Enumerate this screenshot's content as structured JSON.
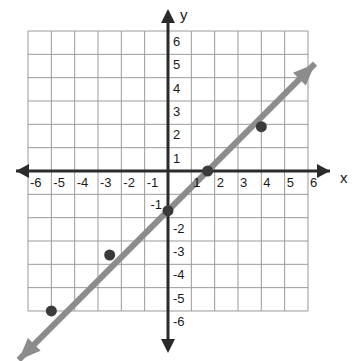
{
  "chart_data": {
    "type": "line",
    "title": "",
    "xlabel": "x",
    "ylabel": "y",
    "grid": true,
    "legend": "none",
    "xlim": [
      -6,
      6
    ],
    "ylim": [
      -6,
      6
    ],
    "x_ticks": [
      -6,
      -5,
      -4,
      -3,
      -2,
      -1,
      1,
      2,
      3,
      4,
      5,
      6
    ],
    "y_ticks": [
      6,
      5,
      4,
      3,
      2,
      1,
      -1,
      -2,
      -3,
      -4,
      -5,
      -6
    ],
    "x_tick_labels": [
      "-6",
      "-5",
      "-4",
      "-3",
      "-2",
      "-1",
      "1",
      "2",
      "3",
      "4",
      "5",
      "6"
    ],
    "y_tick_labels": [
      "6",
      "5",
      "4",
      "3",
      "2",
      "1",
      "-1",
      "-2",
      "-3",
      "-4",
      "-5",
      "-6"
    ],
    "series": [
      {
        "name": "line",
        "type": "line",
        "slope": 1,
        "intercept": -1.7,
        "color": "#8c8c8c",
        "arrow_start": true,
        "arrow_end": true,
        "x_start": -6.4,
        "x_end": 6.3
      },
      {
        "name": "plotted-points",
        "type": "scatter",
        "color": "#3a3a3a",
        "points": [
          {
            "x": -5.0,
            "y": -6.0
          },
          {
            "x": -2.5,
            "y": -3.6
          },
          {
            "x": 0.0,
            "y": -1.7
          },
          {
            "x": 1.7,
            "y": 0.0
          },
          {
            "x": 4.0,
            "y": 1.9
          }
        ]
      }
    ],
    "colors": {
      "grid": "#9a9a9a",
      "axis": "#2b2b2b",
      "line": "#8c8c8c",
      "point": "#3a3a3a",
      "background": "#ffffff",
      "text": "#1a1a1a"
    }
  },
  "axes": {
    "x_axis_name": "x",
    "y_axis_name": "y"
  }
}
